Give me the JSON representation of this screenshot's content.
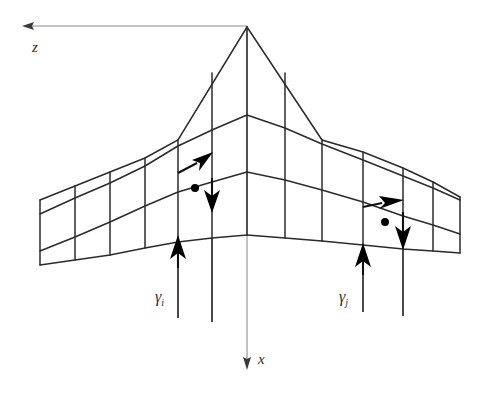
{
  "figure": {
    "background_color": "#ffffff",
    "line_color": "#2b2b2b",
    "axis_color": "#8c8c8c",
    "vortex_color": "#000000",
    "width": 481,
    "height": 393
  },
  "axes": {
    "z": {
      "label": "z",
      "direction": "left",
      "label_x": 32,
      "label_y": 52
    },
    "x": {
      "label": "x",
      "direction": "down",
      "label_x": 258,
      "label_y": 364
    }
  },
  "labels": {
    "gamma_i": {
      "symbol": "γ",
      "subscript": "i",
      "text": "γi",
      "x": 155,
      "y": 302
    },
    "gamma_j": {
      "symbol": "γ",
      "subscript": "j",
      "text": "γj",
      "x": 339,
      "y": 302
    }
  },
  "geometry": {
    "apex": [
      247,
      27
    ],
    "left_tip": [
      40,
      200
    ],
    "right_tip": [
      460,
      197
    ],
    "root_chord_stations": [
      27,
      115,
      172,
      235
    ],
    "left_spar_x": [
      40,
      75,
      110,
      145,
      178,
      212
    ],
    "right_spar_x": [
      285,
      322,
      363,
      403,
      433,
      460
    ],
    "chordwise_rows": 3,
    "spanwise_panels_per_side": 6
  },
  "vortex_rings": [
    {
      "name": "ring-i",
      "side": "left",
      "circulation_label": "γi",
      "control_point": [
        195,
        188
      ],
      "left_leg_x": 178,
      "right_leg_x": 212,
      "arrow_directions": [
        "up",
        "up-right",
        "down",
        "up"
      ]
    },
    {
      "name": "ring-j",
      "side": "right",
      "circulation_label": "γj",
      "control_point": [
        385,
        222
      ],
      "left_leg_x": 363,
      "right_leg_x": 403,
      "arrow_directions": [
        "up",
        "right",
        "down",
        "up"
      ]
    }
  ],
  "trailing_filaments": {
    "count": 5,
    "x_positions": [
      178,
      212,
      363,
      403
    ],
    "end_y": [
      318,
      322,
      312,
      316
    ]
  }
}
